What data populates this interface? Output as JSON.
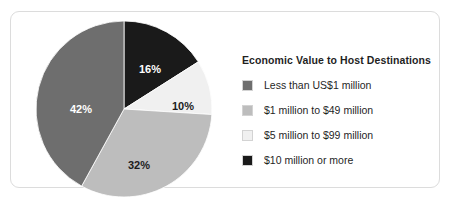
{
  "chart_data": {
    "type": "pie",
    "title": "Economic Value to Host Destinations",
    "xlabel": "",
    "ylabel": "",
    "legend_position": "right",
    "grid": false,
    "start_angle_deg": 0,
    "direction": "clockwise",
    "categories": [
      "Less than US$1 million",
      "$1 million to $49 million",
      "$5 million to $99 million",
      "$10 million or more"
    ],
    "values": [
      42,
      32,
      10,
      16
    ],
    "value_labels": [
      "42%",
      "32%",
      "10%",
      "16%"
    ],
    "colors": [
      "#6e6e6e",
      "#bdbdbd",
      "#f0f0f0",
      "#1a1a1a"
    ],
    "slices": [
      {
        "label": "Less than US$1 million",
        "value": 42,
        "value_label": "42%",
        "color": "#6e6e6e",
        "label_color": "#ffffff"
      },
      {
        "label": "$1 million to $49 million",
        "value": 32,
        "value_label": "32%",
        "color": "#bdbdbd",
        "label_color": "#1c1c1c"
      },
      {
        "label": "$5 million to $99 million",
        "value": 10,
        "value_label": "10%",
        "color": "#f0f0f0",
        "label_color": "#1c1c1c"
      },
      {
        "label": "$10 million or more",
        "value": 16,
        "value_label": "16%",
        "color": "#1a1a1a",
        "label_color": "#ffffff"
      }
    ]
  },
  "legend": {
    "title": "Economic Value to Host Destinations",
    "items": [
      {
        "label": "Less than US$1 million",
        "color": "#6e6e6e"
      },
      {
        "label": "$1 million to $49 million",
        "color": "#bdbdbd"
      },
      {
        "label": "$5 million to $99 million",
        "color": "#f0f0f0"
      },
      {
        "label": "$10 million or more",
        "color": "#1a1a1a"
      }
    ]
  },
  "pie_labels": {
    "black_slice": "16%",
    "light_slice": "10%",
    "medium_slice": "32%",
    "dark_slice": "42%"
  }
}
